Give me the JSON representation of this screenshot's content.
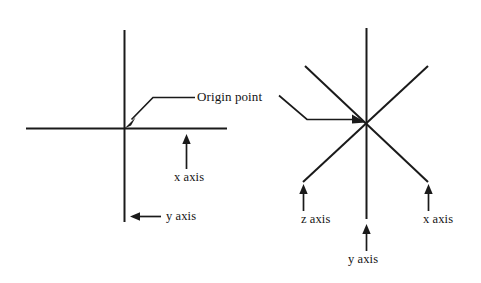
{
  "figure": {
    "background_color": "#ffffff",
    "line_color": "#1a1a1a",
    "text_color": "#141414"
  },
  "annotations": {
    "origin_point": "Origin point"
  },
  "left_diagram": {
    "name": "two-dimensional-axes",
    "labels": {
      "x_axis": "x axis",
      "y_axis": "y axis"
    }
  },
  "right_diagram": {
    "name": "three-dimensional-axes",
    "labels": {
      "z_axis": "z axis",
      "y_axis": "y axis",
      "x_axis": "x axis"
    }
  },
  "geometry": {
    "left": {
      "origin": [
        124,
        128
      ],
      "horizontal": [
        26,
        128,
        227,
        128
      ],
      "vertical": [
        124,
        30,
        124,
        222
      ]
    },
    "right": {
      "origin": [
        366,
        124
      ],
      "vertical": [
        366,
        28,
        366,
        219
      ],
      "diagonal_a": [
        305,
        66,
        428,
        182
      ],
      "diagonal_b": [
        428,
        66,
        303,
        182
      ]
    }
  }
}
